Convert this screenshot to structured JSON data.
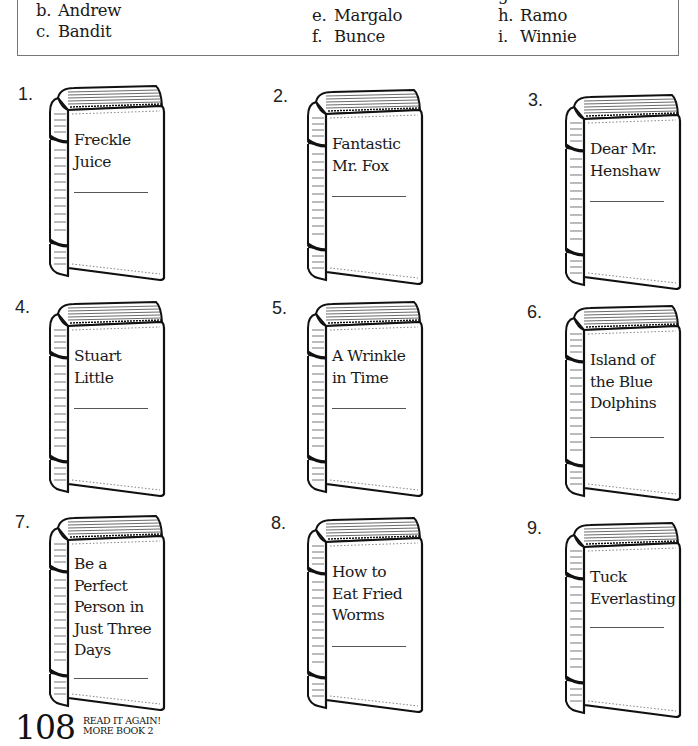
{
  "answer_options": {
    "column_1": [
      {
        "letter": "b.",
        "name": "Andrew"
      },
      {
        "letter": "c.",
        "name": "Bandit"
      }
    ],
    "column_2": [
      {
        "letter": "e.",
        "name": "Margalo"
      },
      {
        "letter": "f.",
        "name": "Bunce"
      }
    ],
    "column_3": [
      {
        "letter": "g.",
        "name": "(cut off)"
      },
      {
        "letter": "h.",
        "name": "Ramo"
      },
      {
        "letter": "i.",
        "name": "Winnie"
      }
    ]
  },
  "books": [
    {
      "number": "1.",
      "title_lines": [
        "Freckle",
        "Juice"
      ]
    },
    {
      "number": "2.",
      "title_lines": [
        "Fantastic",
        "Mr. Fox"
      ]
    },
    {
      "number": "3.",
      "title_lines": [
        "Dear Mr.",
        "Henshaw"
      ]
    },
    {
      "number": "4.",
      "title_lines": [
        "Stuart",
        "Little"
      ]
    },
    {
      "number": "5.",
      "title_lines": [
        "A Wrinkle",
        "in Time"
      ]
    },
    {
      "number": "6.",
      "title_lines": [
        "Island of",
        "the Blue",
        "Dolphins"
      ]
    },
    {
      "number": "7.",
      "title_lines": [
        "Be a",
        "Perfect",
        "Person in",
        "Just Three",
        "Days"
      ]
    },
    {
      "number": "8.",
      "title_lines": [
        "How to",
        "Eat Fried",
        "Worms"
      ]
    },
    {
      "number": "9.",
      "title_lines": [
        "Tuck",
        "Everlasting"
      ]
    }
  ],
  "footer": {
    "page_number": "108",
    "series_line_1": "READ IT AGAIN!",
    "series_line_2": "MORE BOOK 2"
  }
}
